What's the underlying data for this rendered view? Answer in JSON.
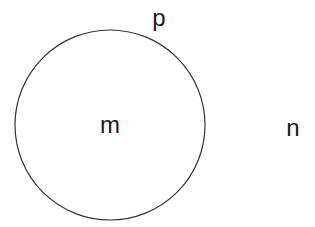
{
  "diagram": {
    "circle": {
      "cx": 110,
      "cy": 125,
      "r": 95,
      "stroke": "#333333"
    },
    "labels": [
      {
        "id": "p",
        "text": "p",
        "x": 159,
        "y": 26
      },
      {
        "id": "m",
        "text": "m",
        "x": 110,
        "y": 133
      },
      {
        "id": "n",
        "text": "n",
        "x": 293,
        "y": 136
      }
    ]
  }
}
